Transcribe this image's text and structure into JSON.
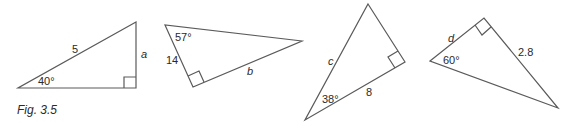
{
  "figure": {
    "caption": "Fig. 3.5",
    "line_color": "#5a5a5a",
    "text_color": "#2a2a2a"
  },
  "triangles": [
    {
      "id": "triangle-1",
      "hypotenuse": "5",
      "unknown": "a",
      "angle": "40°",
      "right_angle": true
    },
    {
      "id": "triangle-2",
      "side": "14",
      "unknown": "b",
      "angle": "57°",
      "right_angle": true
    },
    {
      "id": "triangle-3",
      "unknown": "c",
      "side": "8",
      "angle": "38°",
      "right_angle": true
    },
    {
      "id": "triangle-4",
      "unknown": "d",
      "side": "2.8",
      "angle": "60°",
      "right_angle": true
    }
  ]
}
